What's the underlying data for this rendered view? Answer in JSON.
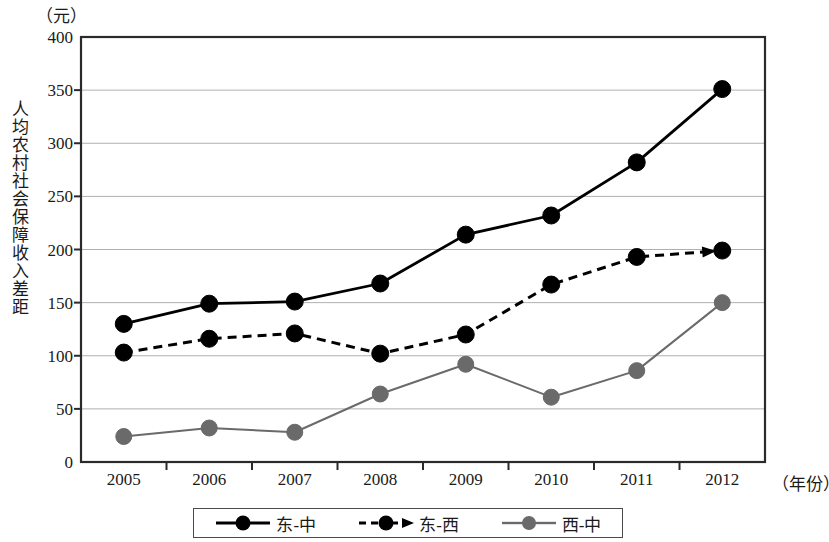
{
  "chart_data": {
    "type": "line",
    "title": "",
    "subtitle": "",
    "xlabel": "（年份）",
    "ylabel": "人均农村社会保障收入差距",
    "yunit": "（元）",
    "categories": [
      "2005",
      "2006",
      "2007",
      "2008",
      "2009",
      "2010",
      "2011",
      "2012"
    ],
    "x": [
      2005,
      2006,
      2007,
      2008,
      2009,
      2010,
      2011,
      2012
    ],
    "ylim": [
      0,
      400
    ],
    "yticks": [
      0,
      50,
      100,
      150,
      200,
      250,
      300,
      350,
      400
    ],
    "ytick_labels": [
      "0",
      "50",
      "100",
      "150",
      "200",
      "250",
      "300",
      "350",
      "400"
    ],
    "grid": "horizontal",
    "legend_position": "bottom",
    "series": [
      {
        "name": "东-中",
        "values": [
          130,
          149,
          151,
          168,
          214,
          232,
          282,
          351
        ],
        "color": "#000000",
        "style": "solid",
        "marker": "circle",
        "marker_color": "#000000",
        "arrow": false
      },
      {
        "name": "东-西",
        "values": [
          103,
          116,
          121,
          102,
          120,
          167,
          193,
          199
        ],
        "color": "#000000",
        "style": "dashed",
        "marker": "circle",
        "marker_color": "#000000",
        "arrow": true
      },
      {
        "name": "西-中",
        "values": [
          24,
          32,
          28,
          64,
          92,
          61,
          86,
          150
        ],
        "color": "#6a6a6a",
        "style": "solid",
        "marker": "circle",
        "marker_color": "#6a6a6a",
        "arrow": false
      }
    ]
  },
  "legend": {
    "items": [
      {
        "label": "东-中"
      },
      {
        "label": "东-西"
      },
      {
        "label": "西-中"
      }
    ]
  },
  "colors": {
    "axis": "#2a2a2a",
    "grid": "#b0b0b0",
    "series_dark": "#000000",
    "series_gray": "#6a6a6a",
    "background": "#ffffff"
  }
}
